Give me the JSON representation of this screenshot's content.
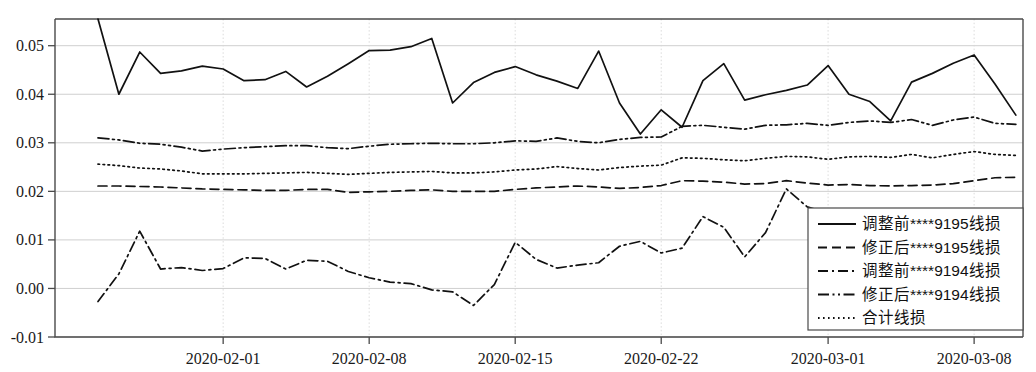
{
  "chart_data": {
    "type": "line",
    "title": "",
    "xlabel": "",
    "ylabel": "",
    "ylim": [
      -0.01,
      0.055
    ],
    "xlim": [
      "2020-01-26",
      "2020-03-10"
    ],
    "grid": true,
    "legend_position": "bottom-right",
    "y_ticks": [
      "-0.01",
      "0.00",
      "0.01",
      "0.02",
      "0.03",
      "0.04",
      "0.05"
    ],
    "y_tick_values": [
      -0.01,
      0.0,
      0.01,
      0.02,
      0.03,
      0.04,
      0.05
    ],
    "x_ticks": [
      "2020-02-01",
      "2020-02-08",
      "2020-02-15",
      "2020-02-22",
      "2020-03-01",
      "2020-03-08"
    ],
    "x_tick_days": [
      6,
      13,
      20,
      27,
      35,
      42
    ],
    "x": [
      "2020-01-26",
      "2020-01-27",
      "2020-01-28",
      "2020-01-29",
      "2020-01-30",
      "2020-01-31",
      "2020-02-01",
      "2020-02-02",
      "2020-02-03",
      "2020-02-04",
      "2020-02-05",
      "2020-02-06",
      "2020-02-07",
      "2020-02-08",
      "2020-02-09",
      "2020-02-10",
      "2020-02-11",
      "2020-02-12",
      "2020-02-13",
      "2020-02-14",
      "2020-02-15",
      "2020-02-16",
      "2020-02-17",
      "2020-02-18",
      "2020-02-19",
      "2020-02-20",
      "2020-02-21",
      "2020-02-22",
      "2020-02-23",
      "2020-02-24",
      "2020-02-25",
      "2020-02-26",
      "2020-02-27",
      "2020-02-28",
      "2020-02-29",
      "2020-03-01",
      "2020-03-02",
      "2020-03-03",
      "2020-03-04",
      "2020-03-05",
      "2020-03-06",
      "2020-03-07",
      "2020-03-08",
      "2020-03-09",
      "2020-03-10"
    ],
    "series": [
      {
        "name": "调整前****9195线损",
        "dash": "none",
        "values": [
          0.0555,
          0.04,
          0.0487,
          0.0443,
          0.0448,
          0.0458,
          0.0452,
          0.0428,
          0.043,
          0.0447,
          0.0415,
          0.0437,
          0.0463,
          0.049,
          0.0491,
          0.0498,
          0.0515,
          0.0382,
          0.0424,
          0.0445,
          0.0457,
          0.044,
          0.0427,
          0.0412,
          0.0489,
          0.0382,
          0.0318,
          0.0368,
          0.0332,
          0.0428,
          0.0463,
          0.0388,
          0.0399,
          0.0408,
          0.0419,
          0.0459,
          0.04,
          0.0385,
          0.0345,
          0.0425,
          0.0443,
          0.0464,
          0.0481,
          0.0421,
          0.0357
        ]
      },
      {
        "name": "修正后****9195线损",
        "dash": "dashed",
        "values": [
          0.0211,
          0.0211,
          0.021,
          0.0209,
          0.0207,
          0.0205,
          0.0204,
          0.0203,
          0.0202,
          0.0202,
          0.0204,
          0.0204,
          0.0198,
          0.0199,
          0.02,
          0.0202,
          0.0203,
          0.02,
          0.02,
          0.02,
          0.0204,
          0.0207,
          0.0209,
          0.0211,
          0.0209,
          0.0206,
          0.0208,
          0.0212,
          0.0222,
          0.0221,
          0.0219,
          0.0215,
          0.0216,
          0.0222,
          0.0217,
          0.0213,
          0.0214,
          0.0212,
          0.0211,
          0.0212,
          0.0213,
          0.0216,
          0.0222,
          0.0228,
          0.0229
        ]
      },
      {
        "name": "调整前****9194线损",
        "dash": "dashdot",
        "values": [
          -0.0027,
          0.003,
          0.0118,
          0.004,
          0.0043,
          0.0037,
          0.0041,
          0.0063,
          0.0062,
          0.004,
          0.0058,
          0.0056,
          0.0035,
          0.0022,
          0.0013,
          0.001,
          -0.0003,
          -0.0007,
          -0.0035,
          0.0008,
          0.0095,
          0.006,
          0.0042,
          0.0048,
          0.0053,
          0.0087,
          0.0097,
          0.0073,
          0.0083,
          0.0148,
          0.0126,
          0.0065,
          0.0115,
          0.0205,
          0.0168,
          0.0155,
          0.0156,
          0.0157,
          0.0128,
          0.0101,
          0.01,
          0.0063,
          0.0005,
          0.004,
          0.0041
        ]
      },
      {
        "name": "修正后****9194线损",
        "dash": "dashdotdot",
        "values": [
          0.031,
          0.0306,
          0.0299,
          0.0297,
          0.0291,
          0.0283,
          0.0287,
          0.029,
          0.0292,
          0.0294,
          0.0294,
          0.029,
          0.0288,
          0.0293,
          0.0297,
          0.0298,
          0.0299,
          0.0298,
          0.0298,
          0.03,
          0.0304,
          0.0303,
          0.031,
          0.0303,
          0.03,
          0.0307,
          0.0311,
          0.0312,
          0.0334,
          0.0336,
          0.0332,
          0.0328,
          0.0336,
          0.0337,
          0.034,
          0.0336,
          0.0342,
          0.0345,
          0.0342,
          0.0348,
          0.0336,
          0.0347,
          0.0353,
          0.034,
          0.0338
        ]
      },
      {
        "name": "合计线损",
        "dash": "dotted",
        "values": [
          0.0256,
          0.0253,
          0.0248,
          0.0246,
          0.0242,
          0.0236,
          0.0236,
          0.0236,
          0.0237,
          0.0238,
          0.0239,
          0.0237,
          0.0235,
          0.0237,
          0.0239,
          0.024,
          0.0241,
          0.0238,
          0.0238,
          0.024,
          0.0244,
          0.0246,
          0.0251,
          0.0247,
          0.0244,
          0.0249,
          0.0252,
          0.0254,
          0.0269,
          0.0268,
          0.0265,
          0.0263,
          0.0268,
          0.0272,
          0.0271,
          0.0266,
          0.0271,
          0.0272,
          0.027,
          0.0276,
          0.0269,
          0.0276,
          0.0282,
          0.0276,
          0.0274
        ]
      }
    ]
  },
  "legend": {
    "items": [
      {
        "label": "调整前****9195线损",
        "dash": "none"
      },
      {
        "label": "修正后****9195线损",
        "dash": "dashed"
      },
      {
        "label": "调整前****9194线损",
        "dash": "dashdot"
      },
      {
        "label": "修正后****9194线损",
        "dash": "dashdotdot"
      },
      {
        "label": "合计线损",
        "dash": "dotted"
      }
    ]
  }
}
